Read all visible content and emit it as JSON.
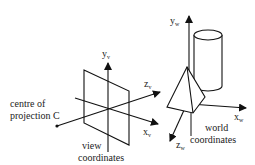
{
  "view_system": {
    "centre_label_line1": "centre of",
    "centre_label_line2": "projection C",
    "caption_line1": "view",
    "caption_line2": "coordinates",
    "axes": {
      "y": {
        "base": "y",
        "sub": "v"
      },
      "z": {
        "base": "z",
        "sub": "v"
      },
      "x": {
        "base": "x",
        "sub": "v"
      }
    }
  },
  "world_system": {
    "caption_line1": "world",
    "caption_line2": "coordinates",
    "axes": {
      "y": {
        "base": "y",
        "sub": "w"
      },
      "x": {
        "base": "x",
        "sub": "w"
      },
      "z": {
        "base": "z",
        "sub": "w"
      }
    },
    "objects": [
      "pyramid",
      "cylinder"
    ]
  },
  "colors": {
    "ink": "#111111",
    "background": "#ffffff"
  }
}
